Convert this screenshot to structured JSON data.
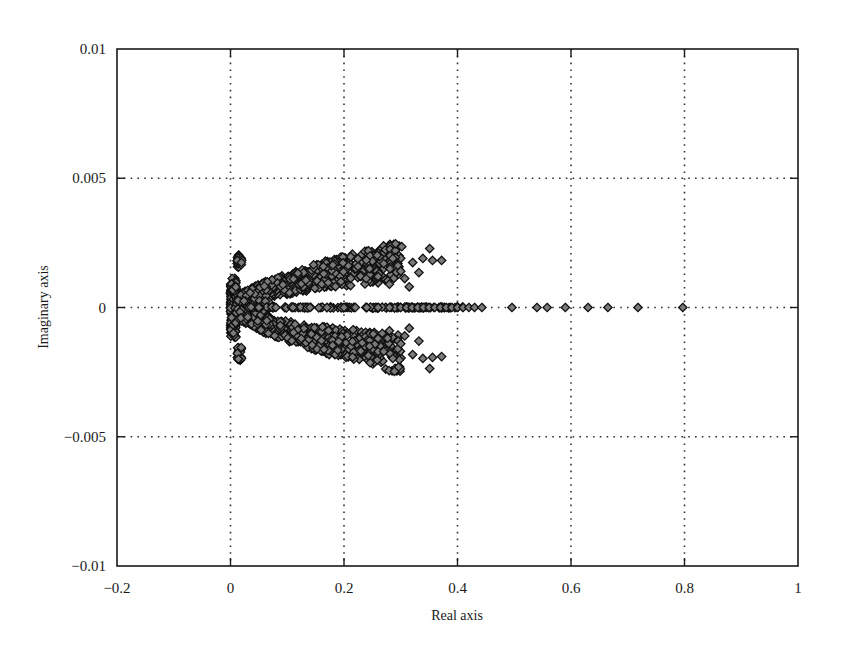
{
  "chart_data": {
    "type": "scatter",
    "title": "",
    "xlabel": "Real axis",
    "ylabel": "Imaginary axis",
    "xlim": [
      -0.2,
      1.0
    ],
    "ylim": [
      -0.01,
      0.01
    ],
    "x_ticks": [
      -0.2,
      0,
      0.2,
      0.4,
      0.6,
      0.8,
      1
    ],
    "x_tick_labels": [
      "−0.2",
      "0",
      "0.2",
      "0.4",
      "0.6",
      "0.8",
      "1"
    ],
    "y_ticks": [
      0.01,
      0.005,
      0,
      -0.005,
      -0.01
    ],
    "y_tick_labels": [
      "0.01",
      "0.005",
      "0",
      "−0.005",
      "−0.01"
    ],
    "grid": "dotted, at interior ticks",
    "legend": "none",
    "marker": "diamond",
    "marker_color": "#7a7a7a",
    "marker_edge": "#111111",
    "series": [
      {
        "name": "eigenvalues",
        "description": "Dense vertical cluster at Re≈0 (Im ±0.0013); two symmetric branches fanning from Re≈0.02 to Re≈0.37 (|Im| up to ≈0.0023); line of real eigenvalues from Re≈0 to Re≈0.8",
        "cluster_origin": {
          "re_range": [
            0.0,
            0.01
          ],
          "im_range": [
            -0.0013,
            0.0013
          ]
        },
        "upper_branch_envelope": [
          [
            0.02,
            0.0003
          ],
          [
            0.05,
            0.0006
          ],
          [
            0.1,
            0.0009
          ],
          [
            0.15,
            0.0012
          ],
          [
            0.2,
            0.0014
          ],
          [
            0.25,
            0.0016
          ],
          [
            0.3,
            0.0018
          ]
        ],
        "lower_branch_envelope": [
          [
            0.02,
            -0.0003
          ],
          [
            0.05,
            -0.0006
          ],
          [
            0.1,
            -0.0009
          ],
          [
            0.15,
            -0.0012
          ],
          [
            0.2,
            -0.0014
          ],
          [
            0.25,
            -0.0016
          ],
          [
            0.3,
            -0.0018
          ]
        ],
        "real_axis_points": [
          0.05,
          0.08,
          0.11,
          0.14,
          0.17,
          0.2,
          0.22,
          0.24,
          0.26,
          0.28,
          0.3,
          0.31,
          0.32,
          0.33,
          0.34,
          0.35,
          0.36,
          0.37,
          0.38,
          0.39,
          0.4,
          0.41,
          0.42,
          0.43,
          0.443,
          0.496,
          0.54,
          0.558,
          0.59,
          0.63,
          0.665,
          0.718,
          0.797
        ],
        "upper_outliers": [
          [
            0.286,
            0.0019
          ],
          [
            0.295,
            0.00162
          ],
          [
            0.307,
            0.00112
          ],
          [
            0.321,
            0.00174
          ],
          [
            0.332,
            0.00135
          ],
          [
            0.339,
            0.0019
          ],
          [
            0.351,
            0.00228
          ],
          [
            0.356,
            0.00182
          ],
          [
            0.372,
            0.00182
          ],
          [
            0.27,
            0.0017
          ],
          [
            0.26,
            0.0012
          ],
          [
            0.3,
            0.0014
          ],
          [
            0.315,
            0.0008
          ],
          [
            0.245,
            0.0015
          ],
          [
            0.28,
            0.0009
          ]
        ],
        "lower_outliers": [
          [
            0.286,
            -0.00197
          ],
          [
            0.295,
            -0.0016
          ],
          [
            0.307,
            -0.0011
          ],
          [
            0.321,
            -0.00182
          ],
          [
            0.332,
            -0.0013
          ],
          [
            0.339,
            -0.00197
          ],
          [
            0.351,
            -0.00236
          ],
          [
            0.356,
            -0.00193
          ],
          [
            0.372,
            -0.0019
          ],
          [
            0.27,
            -0.0017
          ],
          [
            0.26,
            -0.0012
          ],
          [
            0.3,
            -0.0014
          ],
          [
            0.315,
            -0.0008
          ],
          [
            0.245,
            -0.0015
          ],
          [
            0.28,
            -0.0009
          ]
        ]
      }
    ]
  },
  "axes": {
    "xlabel": "Real axis",
    "ylabel": "Imaginary axis"
  }
}
